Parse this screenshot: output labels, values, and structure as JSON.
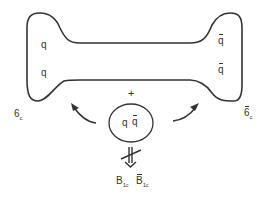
{
  "diagram": {
    "type": "string-breaking illustration",
    "string": {
      "left_end": {
        "labels": [
          "q",
          "q"
        ],
        "color_rep": "6",
        "color_sub": "c"
      },
      "right_end": {
        "labels": [
          "q̄",
          "q̄"
        ],
        "color_rep": "6̄",
        "color_sub": "c"
      }
    },
    "plus_sign": "+",
    "pair": {
      "q": "q",
      "qbar": "q̄"
    },
    "forbidden_arrow": "not-allowed",
    "products": {
      "baryon": {
        "base": "B",
        "sub": "1",
        "subsub": "c"
      },
      "antibaryon": {
        "base": "B̄",
        "sub": "1",
        "subsub": "c"
      }
    },
    "stroke_color": "#333333"
  }
}
